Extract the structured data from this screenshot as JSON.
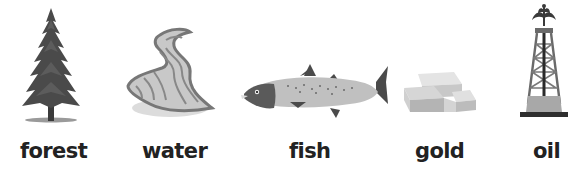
{
  "items": [
    {
      "id": "forest",
      "label": "forest",
      "icon": "pine-tree-icon"
    },
    {
      "id": "water",
      "label": "water",
      "icon": "river-icon"
    },
    {
      "id": "fish",
      "label": "fish",
      "icon": "salmon-icon"
    },
    {
      "id": "gold",
      "label": "gold",
      "icon": "gold-bars-icon"
    },
    {
      "id": "oil",
      "label": "oil",
      "icon": "oil-derrick-icon"
    }
  ],
  "colors": {
    "background": "#ffffff",
    "label_text": "#222222",
    "dark_gray": "#4a4a4a",
    "mid_gray": "#8a8a8a",
    "light_gray": "#c8c8c8"
  }
}
